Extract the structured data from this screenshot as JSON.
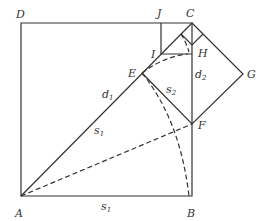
{
  "diagram": {
    "title": "",
    "points": {
      "A": "A",
      "B": "B",
      "C": "C",
      "D": "D",
      "E": "E",
      "F": "F",
      "G": "G",
      "H": "H",
      "I": "I",
      "J": "J"
    },
    "segment_labels": {
      "d1": {
        "base": "d",
        "sub": "1"
      },
      "d2": {
        "base": "d",
        "sub": "2"
      },
      "s1_diag": {
        "base": "s",
        "sub": "1"
      },
      "s1_base": {
        "base": "s",
        "sub": "1"
      },
      "s2": {
        "base": "s",
        "sub": "2"
      }
    },
    "colors": {
      "stroke": "#333333",
      "background": "#ffffff"
    }
  }
}
